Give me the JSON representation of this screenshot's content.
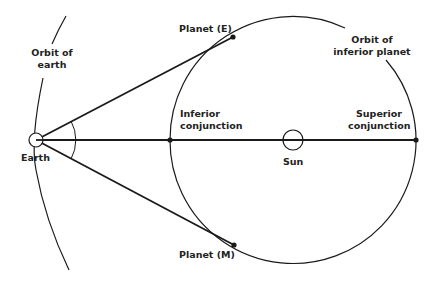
{
  "labels": {
    "orbit_earth_line1": "Orbit of",
    "orbit_earth_line2": "earth",
    "planet_e": "Planet (E)",
    "orbit_inferior_line1": "Orbit of",
    "orbit_inferior_line2": "inferior planet",
    "inferior_conj_line1": "Inferior",
    "inferior_conj_line2": "conjunction",
    "superior_conj_line1": "Superior",
    "superior_conj_line2": "conjunction",
    "sun": "Sun",
    "earth": "Earth",
    "planet_m": "Planet (M)"
  },
  "geometry": {
    "earth": {
      "x": 36,
      "y": 140,
      "r": 7
    },
    "sun": {
      "x": 293,
      "y": 140,
      "r": 10
    },
    "inferior_orbit": {
      "cx": 293,
      "cy": 140,
      "r": 123
    },
    "planet_e": {
      "x": 233,
      "y": 37
    },
    "planet_m": {
      "x": 234,
      "y": 245
    },
    "inferior_conjunction": {
      "x": 170,
      "y": 140
    },
    "superior_conjunction": {
      "x": 416,
      "y": 140
    }
  },
  "colors": {
    "line": "#1a1a1a",
    "text": "#222222",
    "background": "#ffffff"
  }
}
